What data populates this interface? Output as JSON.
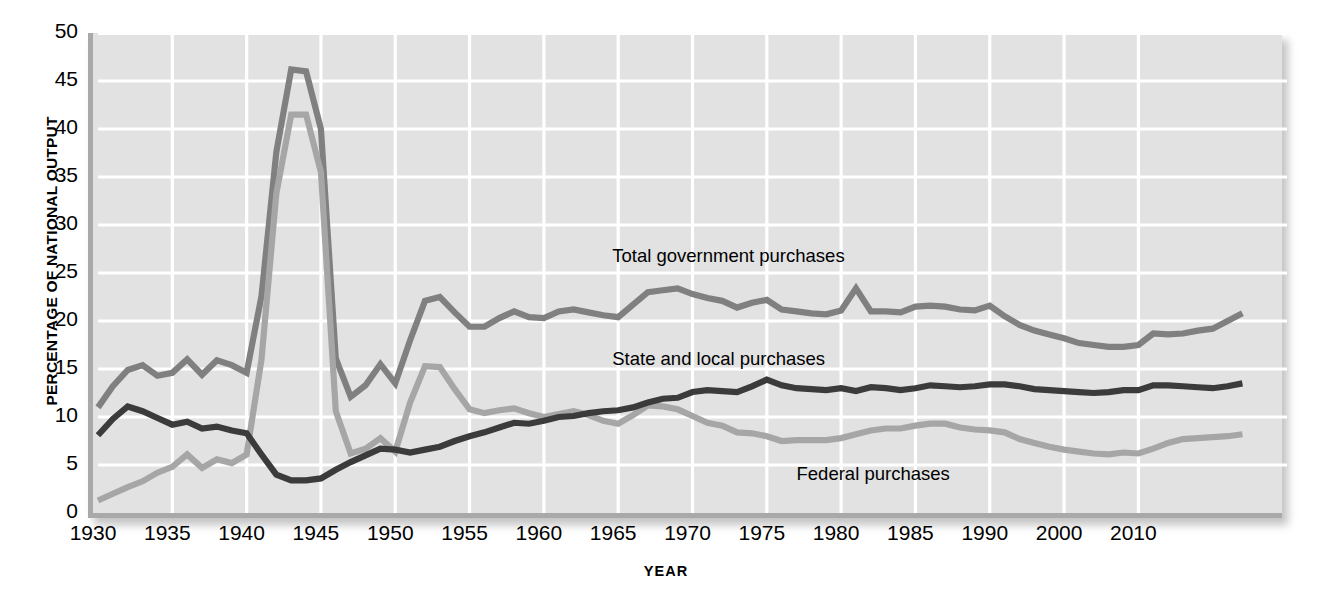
{
  "chart_data": {
    "type": "line",
    "title": "",
    "xlabel": "YEAR",
    "ylabel": "PERCENTAGE OF NATIONAL OUTPUT",
    "xlim": [
      1930,
      2010
    ],
    "ylim": [
      0,
      50
    ],
    "grid": true,
    "legend_position": "inline-annotations",
    "xticks": [
      "1930",
      "1935",
      "1940",
      "1945",
      "1950",
      "1955",
      "1960",
      "1965",
      "1970",
      "1975",
      "1980",
      "1985",
      "1990",
      "2000",
      "2010"
    ],
    "xtick_values": [
      1930,
      1935,
      1940,
      1945,
      1950,
      1955,
      1960,
      1965,
      1970,
      1975,
      1980,
      1985,
      1990,
      1995,
      2000
    ],
    "yticks": [
      "0",
      "5",
      "10",
      "15",
      "20",
      "25",
      "30",
      "35",
      "40",
      "45",
      "50"
    ],
    "ytick_values": [
      0,
      5,
      10,
      15,
      20,
      25,
      30,
      35,
      40,
      45,
      50
    ],
    "x": [
      1930,
      1931,
      1932,
      1933,
      1934,
      1935,
      1936,
      1937,
      1938,
      1939,
      1940,
      1941,
      1942,
      1943,
      1944,
      1945,
      1946,
      1947,
      1948,
      1949,
      1950,
      1951,
      1952,
      1953,
      1954,
      1955,
      1956,
      1957,
      1958,
      1959,
      1960,
      1961,
      1962,
      1963,
      1964,
      1965,
      1966,
      1967,
      1968,
      1969,
      1970,
      1971,
      1972,
      1973,
      1974,
      1975,
      1976,
      1977,
      1978,
      1979,
      1980,
      1981,
      1982,
      1983,
      1984,
      1985,
      1986,
      1987,
      1988,
      1989,
      1990,
      1991,
      1992,
      1993,
      1994,
      1995,
      1996,
      1997,
      1998,
      1999,
      2000,
      2001,
      2002,
      2003,
      2004,
      2005,
      2006,
      2007
    ],
    "series": [
      {
        "name": "Total government purchases",
        "color": "#808080",
        "values": [
          11.0,
          13.2,
          14.9,
          15.4,
          14.3,
          14.6,
          16.0,
          14.4,
          15.9,
          15.4,
          14.6,
          22.6,
          37.6,
          46.2,
          46.0,
          40.0,
          16.1,
          12.1,
          13.3,
          15.5,
          13.5,
          18.0,
          22.1,
          22.5,
          20.9,
          19.4,
          19.4,
          20.3,
          21.0,
          20.4,
          20.3,
          21.0,
          21.2,
          20.9,
          20.6,
          20.4,
          21.7,
          23.0,
          23.2,
          23.4,
          22.8,
          22.4,
          22.1,
          21.4,
          21.9,
          22.2,
          21.2,
          21.0,
          20.8,
          20.7,
          21.1,
          23.4,
          21.0,
          21.0,
          20.9,
          21.5,
          21.6,
          21.5,
          21.2,
          21.1,
          21.6,
          20.5,
          19.6,
          19.0,
          18.6,
          18.2,
          17.7,
          17.5,
          17.3,
          17.3,
          17.5,
          18.7,
          18.6,
          18.7,
          19.0,
          19.2,
          20.0,
          20.8
        ],
        "label_x": 1964.6,
        "label_y": 26.7
      },
      {
        "name": "State and local purchases",
        "color": "#3b3b3b",
        "values": [
          8.1,
          9.8,
          11.1,
          10.6,
          9.9,
          9.2,
          9.5,
          8.8,
          9.0,
          8.6,
          8.3,
          6.1,
          4.0,
          3.4,
          3.4,
          3.6,
          4.5,
          5.3,
          6.0,
          6.7,
          6.6,
          6.3,
          6.6,
          6.9,
          7.5,
          8.0,
          8.4,
          8.9,
          9.4,
          9.3,
          9.6,
          10.0,
          10.1,
          10.4,
          10.6,
          10.7,
          11.0,
          11.5,
          11.9,
          12.0,
          12.6,
          12.8,
          12.7,
          12.6,
          13.2,
          13.9,
          13.3,
          13.0,
          12.9,
          12.8,
          13.0,
          12.7,
          13.1,
          13.0,
          12.8,
          13.0,
          13.3,
          13.2,
          13.1,
          13.2,
          13.4,
          13.4,
          13.2,
          12.9,
          12.8,
          12.7,
          12.6,
          12.5,
          12.6,
          12.8,
          12.8,
          13.3,
          13.3,
          13.2,
          13.1,
          13.0,
          13.2,
          13.5
        ],
        "label_x": 1964.6,
        "label_y": 15.9
      },
      {
        "name": "Federal purchases",
        "color": "#a6a6a6",
        "values": [
          1.3,
          2.0,
          2.7,
          3.3,
          4.2,
          4.8,
          6.1,
          4.7,
          5.6,
          5.2,
          6.1,
          16.0,
          33.3,
          41.5,
          41.5,
          35.5,
          10.6,
          6.2,
          6.7,
          7.8,
          6.4,
          11.5,
          15.3,
          15.2,
          12.9,
          10.8,
          10.4,
          10.7,
          10.9,
          10.4,
          10.0,
          10.3,
          10.6,
          10.2,
          9.6,
          9.3,
          10.2,
          11.2,
          11.1,
          10.8,
          10.1,
          9.4,
          9.1,
          8.4,
          8.3,
          8.0,
          7.5,
          7.6,
          7.6,
          7.6,
          7.8,
          8.2,
          8.6,
          8.8,
          8.8,
          9.1,
          9.3,
          9.3,
          8.9,
          8.7,
          8.6,
          8.4,
          7.7,
          7.3,
          6.9,
          6.6,
          6.4,
          6.2,
          6.1,
          6.3,
          6.2,
          6.7,
          7.3,
          7.7,
          7.8,
          7.9,
          8.0,
          8.2
        ],
        "label_x": 1977.0,
        "label_y": 4.0
      }
    ],
    "annotations": [
      {
        "text": "Total government purchases",
        "x": 1964.6,
        "y": 26.7
      },
      {
        "text": "State and local purchases",
        "x": 1964.6,
        "y": 15.9
      },
      {
        "text": "Federal purchases",
        "x": 1977.0,
        "y": 4.0
      }
    ],
    "colors": {
      "plot_background": "#e2e2e2",
      "gridline": "#ffffff",
      "axis": "#a9a9a9",
      "total_government": "#808080",
      "state_and_local": "#3b3b3b",
      "federal": "#a6a6a6"
    }
  }
}
